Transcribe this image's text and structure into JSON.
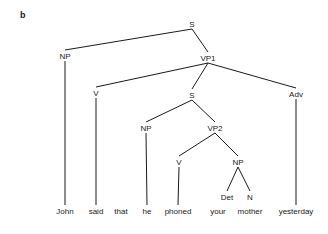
{
  "panel_label": "b",
  "nodes": [
    {
      "id": "S0",
      "label": "S",
      "x": 192,
      "y": 24
    },
    {
      "id": "NP0",
      "label": "NP",
      "x": 65,
      "y": 56
    },
    {
      "id": "VP1",
      "label": "VP1",
      "x": 208,
      "y": 58
    },
    {
      "id": "V0",
      "label": "V",
      "x": 96,
      "y": 93
    },
    {
      "id": "S1",
      "label": "S",
      "x": 192,
      "y": 95
    },
    {
      "id": "ADV",
      "label": "Adv",
      "x": 296,
      "y": 94
    },
    {
      "id": "NP1",
      "label": "NP",
      "x": 146,
      "y": 128
    },
    {
      "id": "VP2",
      "label": "VP2",
      "x": 215,
      "y": 128
    },
    {
      "id": "V1",
      "label": "V",
      "x": 179,
      "y": 162
    },
    {
      "id": "NP2",
      "label": "NP",
      "x": 238,
      "y": 162
    },
    {
      "id": "DET",
      "label": "Det",
      "x": 227,
      "y": 197
    },
    {
      "id": "N",
      "label": "N",
      "x": 250,
      "y": 197
    }
  ],
  "words": [
    {
      "text": "John",
      "x": 65
    },
    {
      "text": "said",
      "x": 96
    },
    {
      "text": "that",
      "x": 121
    },
    {
      "text": "he",
      "x": 147
    },
    {
      "text": "phoned",
      "x": 178
    },
    {
      "text": "your",
      "x": 218
    },
    {
      "text": "mother",
      "x": 250
    },
    {
      "text": "yesterday",
      "x": 296
    }
  ],
  "word_y": 214,
  "edges": [
    [
      "S0",
      "NP0"
    ],
    [
      "S0",
      "VP1"
    ],
    [
      "VP1",
      "V0"
    ],
    [
      "VP1",
      "S1"
    ],
    [
      "VP1",
      "ADV"
    ],
    [
      "S1",
      "NP1"
    ],
    [
      "S1",
      "VP2"
    ],
    [
      "VP2",
      "V1"
    ],
    [
      "VP2",
      "NP2"
    ],
    [
      "NP2",
      "DET"
    ],
    [
      "NP2",
      "N"
    ]
  ],
  "leaf_edges": [
    {
      "node": "NP0",
      "word": 0
    },
    {
      "node": "V0",
      "word": 1
    },
    {
      "node": "NP1",
      "word": 3
    },
    {
      "node": "V1",
      "word": 4
    },
    {
      "node": "ADV",
      "word": 7
    }
  ]
}
